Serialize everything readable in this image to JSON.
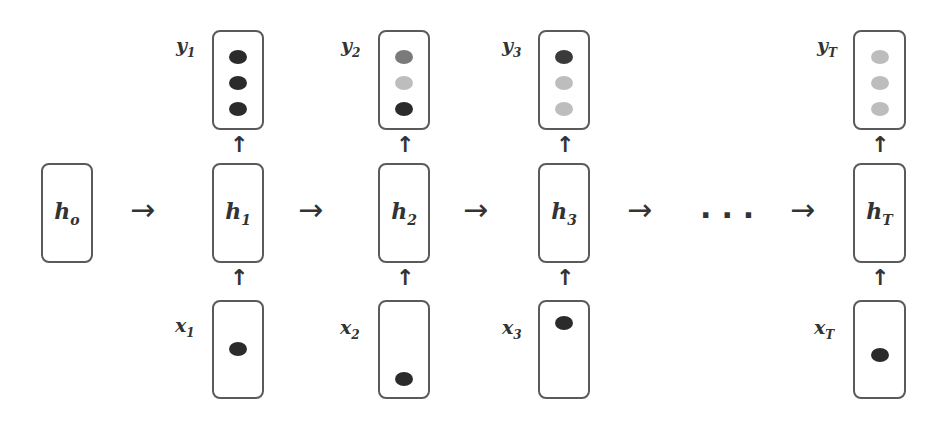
{
  "diagram": {
    "type": "unrolled-rnn",
    "initial_state": {
      "label": "h",
      "sub": "o"
    },
    "ellipsis": "...",
    "arrow_right": "→",
    "arrow_up": "↑",
    "colors": {
      "dark": "#2b2b2b",
      "medium": "#7a7a7a",
      "light": "#bdbdbd",
      "border": "#5a5a5a"
    },
    "timesteps": [
      {
        "hidden": {
          "label": "h",
          "sub": "1"
        },
        "output": {
          "label": "y",
          "sub": "1",
          "dots": [
            "dark",
            "dark",
            "dark"
          ]
        },
        "input": {
          "label": "x",
          "sub": "1",
          "dot_position": "middle"
        }
      },
      {
        "hidden": {
          "label": "h",
          "sub": "2"
        },
        "output": {
          "label": "y",
          "sub": "2",
          "dots": [
            "medium",
            "light",
            "dark"
          ]
        },
        "input": {
          "label": "x",
          "sub": "2",
          "dot_position": "bottom"
        }
      },
      {
        "hidden": {
          "label": "h",
          "sub": "3"
        },
        "output": {
          "label": "y",
          "sub": "3",
          "dots": [
            "dark",
            "light",
            "light"
          ]
        },
        "input": {
          "label": "x",
          "sub": "3",
          "dot_position": "top"
        }
      },
      {
        "hidden": {
          "label": "h",
          "sub": "T"
        },
        "output": {
          "label": "y",
          "sub": "T",
          "dots": [
            "light",
            "light",
            "light"
          ]
        },
        "input": {
          "label": "x",
          "sub": "T",
          "dot_position": "middle"
        }
      }
    ]
  }
}
